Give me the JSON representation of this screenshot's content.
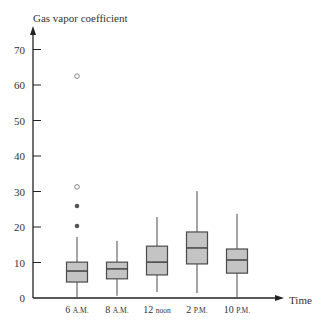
{
  "chart_data": {
    "type": "box",
    "title": "",
    "ylabel": "Gas vapor coefficient",
    "xlabel": "Time",
    "ylim": [
      0,
      75
    ],
    "yticks": [
      0,
      10,
      20,
      30,
      40,
      50,
      60,
      70
    ],
    "grid": false,
    "legend": null,
    "categories": [
      "6 A.M.",
      "8 A.M.",
      "12 noon",
      "2 P.M.",
      "10 P.M."
    ],
    "category_labels": [
      {
        "num": "6",
        "suffix": "A.M."
      },
      {
        "num": "8",
        "suffix": "A.M."
      },
      {
        "num": "12",
        "suffix": "noon"
      },
      {
        "num": "2",
        "suffix": "P.M."
      },
      {
        "num": "10",
        "suffix": "P.M."
      }
    ],
    "boxes": [
      {
        "category": "6 A.M.",
        "whisker_low": 0,
        "q1": 4.5,
        "median": 7.6,
        "q3": 10.1,
        "whisker_high": 17.2,
        "outliers": [
          {
            "value": 20.3,
            "style": "filled"
          },
          {
            "value": 25.9,
            "style": "filled"
          },
          {
            "value": 31.3,
            "style": "open"
          },
          {
            "value": 62.5,
            "style": "open"
          }
        ]
      },
      {
        "category": "8 A.M.",
        "whisker_low": 0.6,
        "q1": 5.4,
        "median": 8.2,
        "q3": 10.1,
        "whisker_high": 16.1,
        "outliers": []
      },
      {
        "category": "12 noon",
        "whisker_low": 1.7,
        "q1": 6.5,
        "median": 10.1,
        "q3": 14.6,
        "whisker_high": 22.8,
        "outliers": []
      },
      {
        "category": "2 P.M.",
        "whisker_low": 1.4,
        "q1": 9.6,
        "median": 14.1,
        "q3": 18.6,
        "whisker_high": 30.1,
        "outliers": []
      },
      {
        "category": "10 P.M.",
        "whisker_low": 0,
        "q1": 7.0,
        "median": 10.7,
        "q3": 13.8,
        "whisker_high": 23.7,
        "outliers": []
      }
    ],
    "colors": {
      "box_fill": "#c4c4c4",
      "box_stroke": "#4a4a4a",
      "axis": "#222222",
      "outlier_filled": "#555555",
      "outlier_open_stroke": "#777777"
    }
  }
}
